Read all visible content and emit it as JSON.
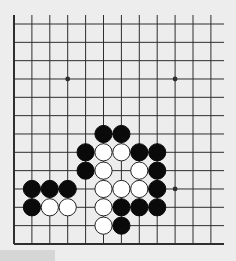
{
  "game": {
    "type": "Go problem (partial board, lower-left corner)",
    "visible_columns": 12,
    "visible_rows": 13,
    "edges": {
      "left": true,
      "bottom": true,
      "top": false,
      "right": false
    },
    "colors": {
      "background": "#ededed",
      "line": "#2e2e2e",
      "black_stone": "#0a0a0a",
      "white_stone": "#ffffff",
      "white_stone_outline": "#222222"
    },
    "star_points": [
      {
        "col": 3,
        "row": 3
      },
      {
        "col": 9,
        "row": 3
      },
      {
        "col": 9,
        "row": 9
      }
    ],
    "stones": [
      {
        "color": "black",
        "col": 5,
        "row": 6
      },
      {
        "color": "black",
        "col": 6,
        "row": 6
      },
      {
        "color": "black",
        "col": 4,
        "row": 7
      },
      {
        "color": "white",
        "col": 5,
        "row": 7
      },
      {
        "color": "white",
        "col": 6,
        "row": 7
      },
      {
        "color": "black",
        "col": 7,
        "row": 7
      },
      {
        "color": "black",
        "col": 8,
        "row": 7
      },
      {
        "color": "black",
        "col": 4,
        "row": 8
      },
      {
        "color": "white",
        "col": 5,
        "row": 8
      },
      {
        "color": "white",
        "col": 7,
        "row": 8
      },
      {
        "color": "black",
        "col": 8,
        "row": 8
      },
      {
        "color": "black",
        "col": 1,
        "row": 9
      },
      {
        "color": "black",
        "col": 2,
        "row": 9
      },
      {
        "color": "black",
        "col": 3,
        "row": 9
      },
      {
        "color": "white",
        "col": 5,
        "row": 9
      },
      {
        "color": "white",
        "col": 6,
        "row": 9
      },
      {
        "color": "white",
        "col": 7,
        "row": 9
      },
      {
        "color": "black",
        "col": 8,
        "row": 9
      },
      {
        "color": "black",
        "col": 1,
        "row": 10
      },
      {
        "color": "white",
        "col": 2,
        "row": 10
      },
      {
        "color": "white",
        "col": 3,
        "row": 10
      },
      {
        "color": "white",
        "col": 5,
        "row": 10
      },
      {
        "color": "black",
        "col": 6,
        "row": 10
      },
      {
        "color": "black",
        "col": 7,
        "row": 10
      },
      {
        "color": "black",
        "col": 8,
        "row": 10
      },
      {
        "color": "white",
        "col": 5,
        "row": 11
      },
      {
        "color": "black",
        "col": 6,
        "row": 11
      }
    ]
  }
}
